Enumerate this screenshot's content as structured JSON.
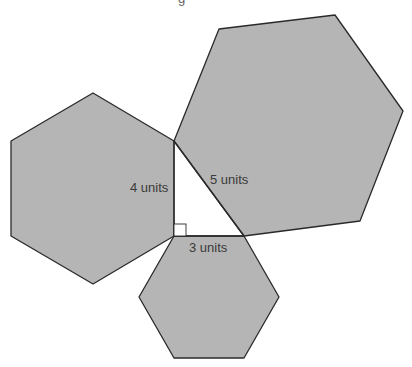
{
  "diagram": {
    "colors": {
      "hexagon_fill": "#b5b5b5",
      "stroke": "#2a2a2a",
      "background": "#ffffff",
      "label": "#3a3a3a"
    },
    "triangle": {
      "vertices": [
        [
          174,
          141
        ],
        [
          174,
          236
        ],
        [
          244,
          236
        ]
      ],
      "right_angle_at": [
        174,
        236
      ]
    },
    "hexagons": [
      {
        "name": "left-hexagon",
        "side": "vertical leg",
        "points": "174,141 174,236 93,284 11,236 11,141 93,93"
      },
      {
        "name": "large-hexagon",
        "side": "hypotenuse",
        "points": "174,141 219,29 335,15 403,111 360,221 244,236"
      },
      {
        "name": "bottom-hexagon",
        "side": "horizontal leg",
        "points": "174,236 244,236 279,297 244,358 174,358 139,297"
      }
    ],
    "labels": {
      "left_leg": "4 units",
      "hypotenuse": "5 units",
      "bottom_leg": "3 units"
    },
    "top_fragment": "g"
  }
}
